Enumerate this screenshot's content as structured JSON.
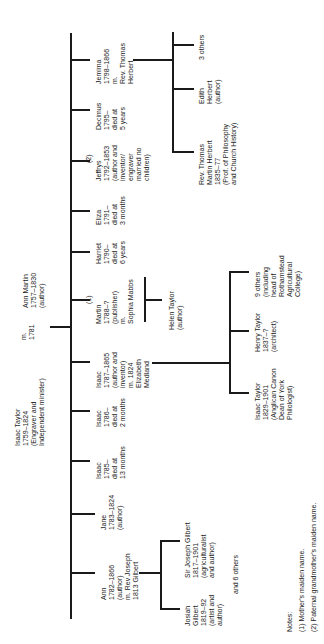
{
  "parents": {
    "father": "Isaac Taylor\n1759–1824\n(Engraver and\nIndependent minister)",
    "marriage": "m.\n1781",
    "mother": "Ann Martin\n1757–1830\n(author)"
  },
  "children": [
    {
      "label": "Ann\n1782–1866\n(author)\nm. Rev Joseph\n1813 Gilbert"
    },
    {
      "label": "Jane\n1783–1824\n(author)"
    },
    {
      "label": "Isaac\n1785–\ndied at\n13 months"
    },
    {
      "label": "Isaac\n1786–\ndied at\n2 months"
    },
    {
      "label": "Isaac\n1787–1865\n(author and\ninventor)\nm. 1824\nElizabeth\nMedland"
    },
    {
      "note": "(1)",
      "label": "Martin\n1788–?\n(publisher)\nm.\nSophia Mabbs"
    },
    {
      "label": "Harriet\n1790–\ndied at\n6 years"
    },
    {
      "label": "Eliza\n1791–\ndied at\n3 months"
    },
    {
      "note": "(2)",
      "label": "Jeffrys\n1792–1853\n(author and\ninventor/\nengraver\nmarried no\nchildren)"
    },
    {
      "label": "Decimus\n1795–\ndied at\n5 years"
    },
    {
      "label": "Jemima\n1798–1866\nm.\nRev. Thomas\nHerbert"
    }
  ],
  "grandchildren": {
    "gilbert": [
      {
        "label": "Josiah\nGilbert\n1819–92\n(artist and\nauthor)"
      },
      {
        "label": "Sir Joseph Gilbert\n1817–1901\n(agriculturalist\nand author)"
      }
    ],
    "gilbert_others": "and 6 others",
    "isaac": [
      {
        "label": "Isaac Taylor\n1829–1901\n(Anglican Canon\nDean of York\nPhilologist)"
      },
      {
        "label": "Henry Taylor\n1837–?\n(architect)"
      },
      {
        "label": "9 others\n(including\nhead of\nRothamstead\nAgricultural\nCollege)"
      }
    ],
    "martin": [
      {
        "label": "Helen Taylor\n(author)"
      }
    ],
    "herbert": [
      {
        "label": "Rev. Thomas\nMartin Herbert\n1835–77\n(Prof. of Philosophy\nand Church History)"
      },
      {
        "label": "Edith\nHerbert\n(author)"
      },
      {
        "label": "3 others"
      }
    ]
  },
  "notes": {
    "heading": "Notes:",
    "items": [
      "(1) Mother's maiden name.",
      "(2) Paternal grandmother's maiden name."
    ]
  }
}
